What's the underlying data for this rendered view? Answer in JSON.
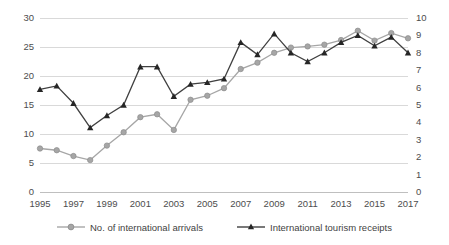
{
  "chart_data": {
    "type": "line",
    "title": "",
    "xlabel": "",
    "ylabel": "",
    "x": [
      1995,
      1996,
      1997,
      1998,
      1999,
      2000,
      2001,
      2002,
      2003,
      2004,
      2005,
      2006,
      2007,
      2008,
      2009,
      2010,
      2011,
      2012,
      2013,
      2014,
      2015,
      2016,
      2017
    ],
    "xtick_labels": [
      "1995",
      "1997",
      "1999",
      "2001",
      "2003",
      "2005",
      "2007",
      "2009",
      "2011",
      "2013",
      "2015",
      "2017"
    ],
    "xtick_values": [
      1995,
      1997,
      1999,
      2001,
      2003,
      2005,
      2007,
      2009,
      2011,
      2013,
      2015,
      2017
    ],
    "grid": true,
    "legend_position": "bottom",
    "axes": [
      {
        "id": "left",
        "label": "",
        "ylim": [
          0,
          30
        ],
        "ticks": [
          0,
          5,
          10,
          15,
          20,
          25,
          30
        ],
        "tick_labels": [
          "0",
          "5",
          "10",
          "15",
          "20",
          "25",
          "30"
        ]
      },
      {
        "id": "right",
        "label": "",
        "ylim": [
          0,
          10
        ],
        "ticks": [
          0,
          1,
          2,
          3,
          4,
          5,
          6,
          7,
          8,
          9,
          10
        ],
        "tick_labels": [
          "0",
          "1",
          "2",
          "3",
          "4",
          "5",
          "6",
          "7",
          "8",
          "9",
          "10"
        ]
      }
    ],
    "series": [
      {
        "name": "No. of international arrivals",
        "axis": "left",
        "color": "#a6a6a6",
        "marker": "circle",
        "values": [
          7.5,
          7.2,
          6.2,
          5.5,
          8.0,
          10.3,
          12.9,
          13.4,
          10.7,
          15.9,
          16.6,
          17.9,
          21.2,
          22.3,
          24.0,
          24.9,
          25.1,
          25.4,
          26.2,
          27.8,
          26.1,
          27.4,
          26.5
        ]
      },
      {
        "name": "International tourism receipts",
        "axis": "right",
        "color": "#404040",
        "marker": "triangle",
        "values": [
          5.9,
          6.1,
          5.1,
          3.7,
          4.4,
          5.0,
          7.2,
          7.2,
          5.5,
          6.2,
          6.3,
          6.5,
          8.6,
          7.9,
          9.1,
          8.0,
          7.5,
          8.0,
          8.6,
          9.0,
          8.4,
          8.9,
          8.0
        ]
      }
    ]
  }
}
